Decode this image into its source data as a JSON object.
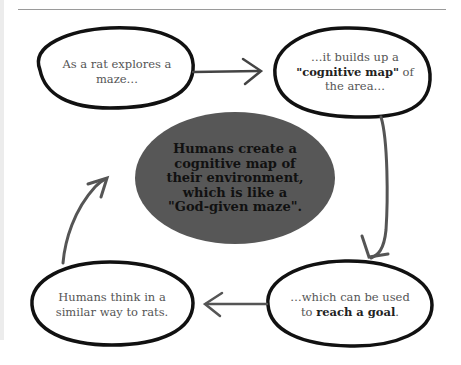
{
  "diagram": {
    "type": "cycle-flow",
    "nodes": [
      {
        "id": "rat-explores",
        "lines": [
          "As a rat explores a",
          "maze…"
        ]
      },
      {
        "id": "cognitive-map",
        "line1": "…it builds up a",
        "line2_bold": "\"cognitive map\"",
        "line2_rest": " of",
        "line3": "the area…"
      },
      {
        "id": "reach-goal",
        "line1": "…which can be used",
        "line2_pre": "to ",
        "line2_bold": "reach a goal",
        "line2_post": "."
      },
      {
        "id": "humans-think",
        "lines": [
          "Humans think in a",
          "similar way to rats."
        ]
      }
    ],
    "center": {
      "lines": [
        "Humans create a",
        "cognitive map of",
        "their environment,",
        "which is like a",
        "\"God-given maze\"."
      ],
      "fill": "#575757",
      "text_color": "#111111"
    },
    "edges": [
      {
        "from": "rat-explores",
        "to": "cognitive-map",
        "direction": "right"
      },
      {
        "from": "cognitive-map",
        "to": "reach-goal",
        "direction": "down"
      },
      {
        "from": "reach-goal",
        "to": "humans-think",
        "direction": "left"
      },
      {
        "from": "humans-think",
        "to": "center",
        "direction": "up"
      }
    ],
    "colors": {
      "outline": "#111111",
      "arrow": "#555555",
      "label_text": "#555555"
    }
  }
}
